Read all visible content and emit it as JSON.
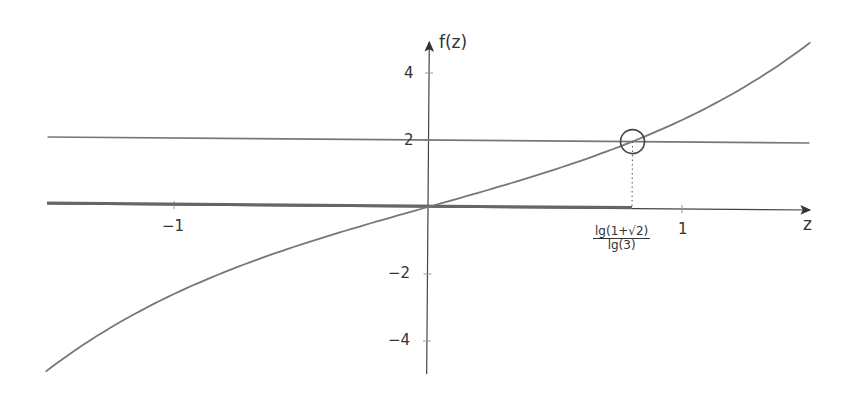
{
  "chart_data": {
    "type": "line",
    "title": "",
    "xlabel": "z",
    "ylabel": "f(z)",
    "xlim": [
      -1.5,
      1.5
    ],
    "ylim": [
      -5,
      5
    ],
    "grid": false,
    "legend": null,
    "x_ticks": [
      {
        "value": -1,
        "label": "−1"
      },
      {
        "value": 1,
        "label": "1"
      }
    ],
    "y_ticks": [
      {
        "value": 4,
        "label": "4"
      },
      {
        "value": 2,
        "label": "2"
      },
      {
        "value": -2,
        "label": "−2"
      },
      {
        "value": -4,
        "label": "−4"
      }
    ],
    "series": [
      {
        "name": "f(z) = 3^z − 3^(−z)",
        "kind": "curve",
        "x": [
          -1.5,
          -1.25,
          -1.0,
          -0.75,
          -0.5,
          -0.25,
          0.0,
          0.25,
          0.5,
          0.75,
          0.802,
          1.0,
          1.25,
          1.5
        ],
        "values": [
          -5.0,
          -3.7,
          -2.67,
          -1.84,
          -1.15,
          -0.56,
          0.0,
          0.56,
          1.15,
          1.84,
          2.0,
          2.67,
          3.7,
          5.0
        ]
      },
      {
        "name": "y = 2",
        "kind": "horizontal-line",
        "x": [
          -1.5,
          1.5
        ],
        "values": [
          2,
          2
        ]
      },
      {
        "name": "y = 0 (highlighted segment)",
        "kind": "thick-segment",
        "x": [
          -1.5,
          0.802
        ],
        "values": [
          0,
          0
        ]
      }
    ],
    "annotations": [
      {
        "type": "circle-marker",
        "x": 0.802,
        "y": 2
      },
      {
        "type": "dotted-drop-line",
        "x": 0.802,
        "from_y": 2,
        "to_y": 0
      },
      {
        "type": "x-label",
        "x": 0.802,
        "numerator": "lg(1+√2)",
        "denominator": "lg(3)"
      }
    ]
  },
  "labels": {
    "x_axis": "z",
    "y_axis": "f(z)",
    "tick_x_neg1": "−1",
    "tick_x_1": "1",
    "tick_y_4": "4",
    "tick_y_2": "2",
    "tick_y_neg2": "−2",
    "tick_y_neg4": "−4",
    "frac_num": "lg(1+√2)",
    "frac_den": "lg(3)"
  },
  "colors": {
    "curve": "#777777",
    "axis": "#444444",
    "thick": "#666666"
  }
}
